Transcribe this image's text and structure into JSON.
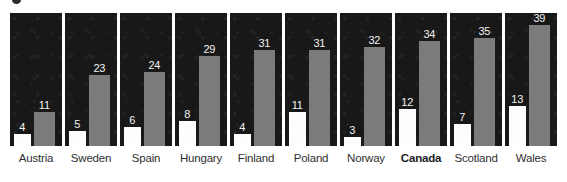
{
  "chart_data": {
    "type": "bar",
    "title": "",
    "subtitle": "",
    "xlabel": "",
    "ylabel": "",
    "ylim": [
      0,
      43
    ],
    "grid": false,
    "legend_position": "none",
    "orientation": "vertical",
    "panel_layout": "one panel per category",
    "categories": [
      "Austria",
      "Sweden",
      "Spain",
      "Hungary",
      "Finland",
      "Poland",
      "Norway",
      "Canada",
      "Scotland",
      "Wales"
    ],
    "highlighted_category": "Canada",
    "series": [
      {
        "name": "low",
        "color": "#fdfdfd",
        "values": [
          4,
          5,
          6,
          8,
          4,
          11,
          3,
          12,
          7,
          13
        ]
      },
      {
        "name": "high",
        "color": "#7b7b7b",
        "values": [
          11,
          23,
          24,
          29,
          31,
          31,
          32,
          34,
          35,
          39
        ]
      }
    ],
    "bar_labels": {
      "low": [
        "4",
        "5",
        "6",
        "8",
        "4",
        "11",
        "3",
        "12",
        "7",
        "13"
      ],
      "high": [
        "11",
        "23",
        "24",
        "29",
        "31",
        "31",
        "32",
        "34",
        "35",
        "39"
      ]
    }
  },
  "style": {
    "panel_background": "#181818",
    "page_background": "#ffffff",
    "value_label_color": "#f2f2f2",
    "category_label_color": "#2f2f2f"
  }
}
